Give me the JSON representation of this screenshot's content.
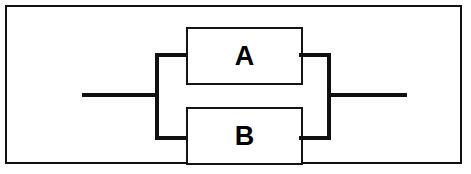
{
  "figure": {
    "type": "parallel-block-diagram",
    "background_color": "#ffffff",
    "frame_color": "#111111",
    "wire_color": "#101010",
    "block_border_color": "#151515",
    "label_color": "#000000"
  },
  "blocks": [
    {
      "id": "a",
      "label": "A",
      "position": "top-branch"
    },
    {
      "id": "b",
      "label": "B",
      "position": "bottom-branch"
    }
  ],
  "wires": {
    "lead_left": "",
    "lead_right": "",
    "bus_left": "",
    "bus_right": "",
    "branch_left_top": "",
    "branch_left_bottom": "",
    "branch_right_top": "",
    "branch_right_bottom": ""
  }
}
